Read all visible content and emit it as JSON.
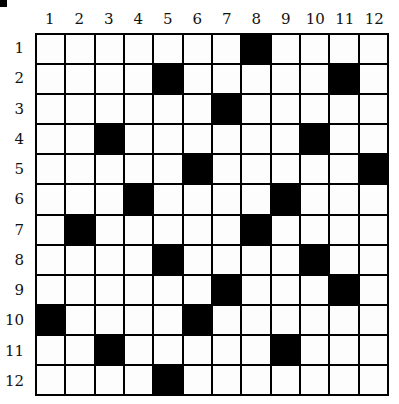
{
  "puzzle": {
    "rows": 12,
    "cols": 12,
    "column_labels": [
      "1",
      "2",
      "3",
      "4",
      "5",
      "6",
      "7",
      "8",
      "9",
      "10",
      "11",
      "12"
    ],
    "row_labels": [
      "1",
      "2",
      "3",
      "4",
      "5",
      "6",
      "7",
      "8",
      "9",
      "10",
      "11",
      "12"
    ],
    "black_cells": {
      "1": [
        8
      ],
      "2": [
        5,
        11
      ],
      "3": [
        7
      ],
      "4": [
        3,
        10
      ],
      "5": [
        6,
        12
      ],
      "6": [
        4,
        9
      ],
      "7": [
        2,
        8
      ],
      "8": [
        5,
        10
      ],
      "9": [
        7,
        11
      ],
      "10": [
        1,
        6
      ],
      "11": [
        3,
        9
      ],
      "12": [
        5
      ]
    },
    "colors": {
      "filled": "#000000",
      "empty": "#ffffff",
      "grid_line": "#000000"
    }
  }
}
